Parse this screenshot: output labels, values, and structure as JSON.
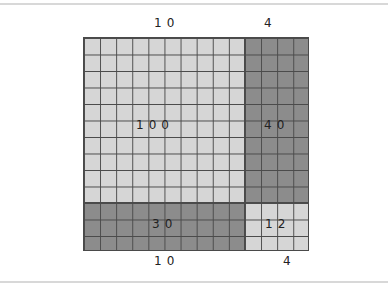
{
  "diagram": {
    "top_labels": [
      "10",
      "4"
    ],
    "bottom_labels": [
      "10",
      "4"
    ],
    "regions": [
      {
        "name": "top-left",
        "cols": 10,
        "rows": 10,
        "value": "100",
        "shade": "light"
      },
      {
        "name": "top-right",
        "cols": 4,
        "rows": 10,
        "value": "40",
        "shade": "dark"
      },
      {
        "name": "bottom-left",
        "cols": 10,
        "rows": 3,
        "value": "30",
        "shade": "dark"
      },
      {
        "name": "bottom-right",
        "cols": 4,
        "rows": 3,
        "value": "12",
        "shade": "light"
      }
    ],
    "colors": {
      "light": "#d6d6d6",
      "dark": "#8c8c8c",
      "grid_line": "#4a4a4a"
    }
  }
}
